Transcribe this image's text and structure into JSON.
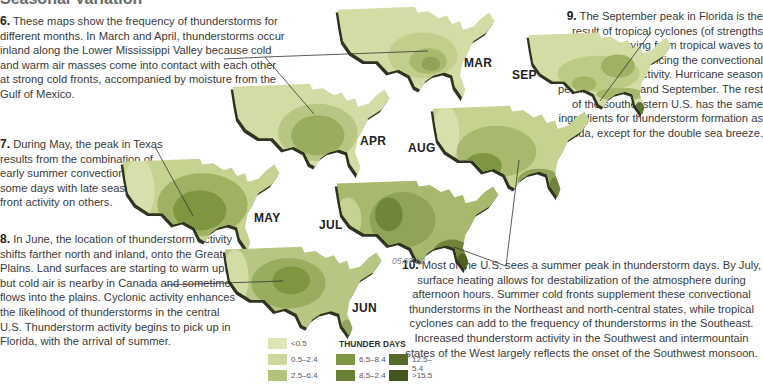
{
  "heading": "Seasonal Variation",
  "paragraphs": {
    "p6": {
      "num": "6.",
      "text": "These maps show the frequency of thunderstorms for different months. In March and April, thunderstorms occur inland along the Lower Mississippi Valley because cold and warm air masses come into contact with each other at strong cold fronts, accompanied by moisture from the Gulf of Mexico."
    },
    "p7": {
      "num": "7.",
      "text": "During May, the peak in Texas results from the combination of early summer convection on some days with late season cold-front activity on others."
    },
    "p8": {
      "num": "8.",
      "text": "In June, the location of thunderstorm activity shifts farther north and inland, onto the Great Plains. Land surfaces are starting to warm up, but cold air is nearby in Canada and sometimes flows into the plains. Cyclonic activity enhances the likelihood of thunderstorms in the central U.S. Thunderstorm activity begins to pick up in Florida, with the arrival of summer."
    },
    "p9": {
      "num": "9.",
      "text": "The September peak in Florida is the result of tropical cyclones (of strengths varying from tropical waves to hurricanes), enhancing the convectional thunderstorm activity. Hurricane season peaks in August and September. The rest of the southeastern U.S. has the same ingredients for thunderstorm formation as Florida, except for the double sea breeze."
    },
    "p10": {
      "num": "10.",
      "text": "Most of the U.S. sees a summer peak in thunderstorm days. By July, surface heating allows for destabilization of the atmosphere during afternoon hours. Summer cold fronts supplement these convectional thunderstorms in the Northeast and north-central states, while tropical cyclones can add to the frequency of thunderstorms in the Southeast. Increased thunderstorm activity in the Southwest and intermountain states of the West largely reflects the onset of the Southwest monsoon."
    }
  },
  "maps": {
    "mar": {
      "label": "MAR"
    },
    "apr": {
      "label": "APR"
    },
    "may": {
      "label": "MAY"
    },
    "jun": {
      "label": "JUN"
    },
    "jul": {
      "label": "JUL"
    },
    "aug": {
      "label": "AUG"
    },
    "sep": {
      "label": "SEP"
    }
  },
  "figure_code": "05.07.b2",
  "legend": {
    "title": "THUNDER DAYS",
    "items": [
      {
        "label": "<0.5",
        "color": "#dfe6b4"
      },
      {
        "label": "0.5–2.4",
        "color": "#ccd89a"
      },
      {
        "label": "2.5–6.4",
        "color": "#b3c47a"
      },
      {
        "label": "6.5–8.4",
        "color": "#7e9640"
      },
      {
        "label": "8.5–2.4",
        "color": "#6a8034"
      },
      {
        "label": "12.5–5.4",
        "color": "#566a2a"
      },
      {
        "label": ">15.5",
        "color": "#44561f"
      }
    ]
  },
  "colors": {
    "base": "#d3dca5",
    "shadow": "#2f3320",
    "mid": "#b8c683",
    "dark": "#8fa456",
    "darker": "#6f8538",
    "darkest": "#4f6224"
  }
}
